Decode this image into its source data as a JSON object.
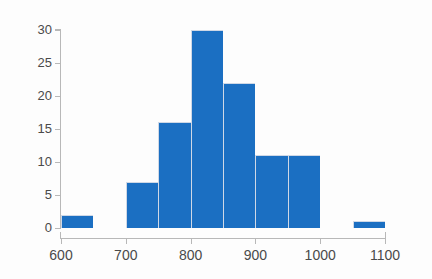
{
  "chart_data": {
    "type": "bar",
    "title": "",
    "subtitle": "",
    "xlabel": "",
    "ylabel": "",
    "xlim": [
      600,
      1100
    ],
    "ylim": [
      0,
      30
    ],
    "grid": false,
    "legend": null,
    "bin_width": 50,
    "bin_edges": [
      600,
      650,
      700,
      750,
      800,
      850,
      900,
      950,
      1000,
      1050,
      1100
    ],
    "categories": [
      "600-650",
      "650-700",
      "700-750",
      "750-800",
      "800-850",
      "850-900",
      "900-950",
      "950-1000",
      "1000-1050",
      "1050-1100"
    ],
    "values": [
      2,
      0,
      7,
      16,
      30,
      22,
      11,
      11,
      0,
      1
    ],
    "bars": [
      {
        "label": "600-650",
        "start": 600,
        "end": 650,
        "value": 2
      },
      {
        "label": "650-700",
        "start": 650,
        "end": 700,
        "value": 0
      },
      {
        "label": "700-750",
        "start": 700,
        "end": 750,
        "value": 7
      },
      {
        "label": "750-800",
        "start": 750,
        "end": 800,
        "value": 16
      },
      {
        "label": "800-850",
        "start": 800,
        "end": 850,
        "value": 30
      },
      {
        "label": "850-900",
        "start": 850,
        "end": 900,
        "value": 22
      },
      {
        "label": "900-950",
        "start": 900,
        "end": 950,
        "value": 11
      },
      {
        "label": "950-1000",
        "start": 950,
        "end": 1000,
        "value": 11
      },
      {
        "label": "1000-1050",
        "start": 1000,
        "end": 1050,
        "value": 0
      },
      {
        "label": "1050-1100",
        "start": 1050,
        "end": 1100,
        "value": 1
      }
    ],
    "x_ticks": [
      600,
      700,
      800,
      900,
      1000,
      1100
    ],
    "x_tick_labels": [
      "600",
      "700",
      "800",
      "900",
      "1000",
      "1100"
    ],
    "y_ticks": [
      0,
      5,
      10,
      15,
      20,
      25,
      30
    ],
    "y_tick_labels": [
      "0",
      "5",
      "10",
      "15",
      "20",
      "25",
      "30"
    ],
    "colors": {
      "bar_fill": "#1b6fc2",
      "bar_edge": "#cfd8e6",
      "axis": "#b8b8b8",
      "tick_label": "#4a4a4a",
      "background": "#fdfdfd"
    }
  }
}
